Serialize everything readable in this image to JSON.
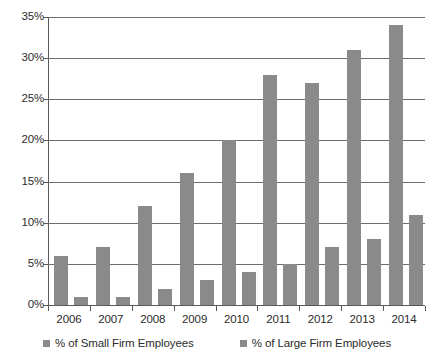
{
  "chart_data": {
    "type": "bar",
    "title": "",
    "subtitle": "",
    "xlabel": "",
    "ylabel": "",
    "categories": [
      "2006",
      "2007",
      "2008",
      "2009",
      "2010",
      "2011",
      "2012",
      "2013",
      "2014"
    ],
    "series": [
      {
        "name": "% of Small Firm Employees",
        "color": "#8a8a8a",
        "values": [
          6,
          7,
          12,
          16,
          20,
          28,
          27,
          31,
          34
        ]
      },
      {
        "name": "% of Large Firm Employees",
        "color": "#8a8a8a",
        "values": [
          1,
          1,
          2,
          3,
          4,
          5,
          7,
          8,
          11
        ]
      }
    ],
    "ylim": [
      0,
      35
    ],
    "ytick_values": [
      0,
      5,
      10,
      15,
      20,
      25,
      30,
      35
    ],
    "ytick_labels": [
      "0%",
      "5%",
      "10%",
      "15%",
      "20%",
      "25%",
      "30%",
      "35%"
    ],
    "grid": true,
    "grid_axis": "y",
    "legend_position": "bottom",
    "legend": [
      {
        "label": "% of Small Firm Employees",
        "swatch": "legend-swatch-icon"
      },
      {
        "label": "% of Large Firm Employees",
        "swatch": "legend-swatch-icon"
      }
    ]
  }
}
